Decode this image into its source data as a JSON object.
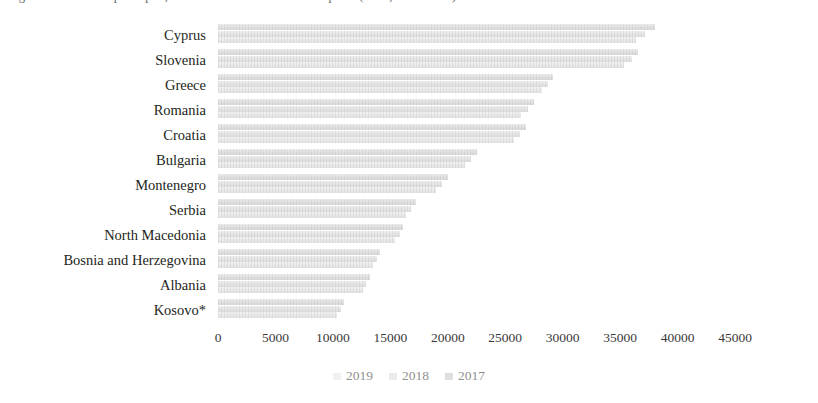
{
  "figure": {
    "caption": "Figure 1. Real GDP per capita, Western Balkans and selected peers (EUR, 2017-2019)"
  },
  "chart_data": {
    "type": "bar",
    "orientation": "horizontal",
    "title": "",
    "xlabel": "",
    "ylabel": "",
    "xlim": [
      0,
      45000
    ],
    "xticks": [
      0,
      5000,
      10000,
      15000,
      20000,
      25000,
      30000,
      35000,
      40000,
      45000
    ],
    "xtick_labels": [
      "0",
      "5000",
      "10000",
      "15000",
      "20000",
      "25000",
      "30000",
      "35000",
      "40000",
      "45000"
    ],
    "grid": false,
    "legend_position": "bottom",
    "categories": [
      "Cyprus",
      "Slovenia",
      "Greece",
      "Romania",
      "Croatia",
      "Bulgaria",
      "Montenegro",
      "Serbia",
      "North Macedonia",
      "Bosnia and Herzegovina",
      "Albania",
      "Kosovo*"
    ],
    "series": [
      {
        "name": "2019",
        "color": "#e2e2e2",
        "values": [
          38000,
          36600,
          29200,
          27500,
          26800,
          22500,
          20000,
          17200,
          16100,
          14100,
          13200,
          11000
        ]
      },
      {
        "name": "2018",
        "color": "#e6e6e6",
        "values": [
          37200,
          36000,
          28700,
          27000,
          26300,
          22000,
          19500,
          16800,
          15800,
          13800,
          12900,
          10700
        ]
      },
      {
        "name": "2017",
        "color": "#eaeaea",
        "values": [
          36400,
          35300,
          28200,
          26400,
          25800,
          21500,
          19000,
          16400,
          15400,
          13500,
          12600,
          10400
        ]
      }
    ]
  },
  "legend": {
    "items": [
      {
        "label": "2019"
      },
      {
        "label": "2018"
      },
      {
        "label": "2017"
      }
    ]
  }
}
